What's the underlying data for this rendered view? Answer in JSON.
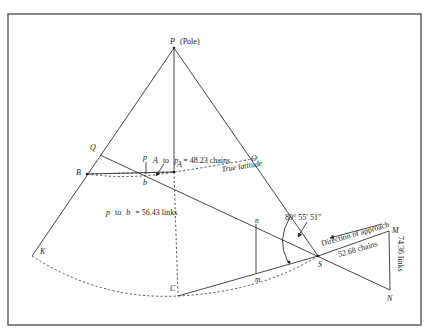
{
  "diagram": {
    "points": {
      "P": "P",
      "pole_note": "(Pole)",
      "Q": "Q",
      "B": "B",
      "A": "A",
      "O": "O",
      "K": "K",
      "C": "C",
      "S": "S",
      "M": "M",
      "N": "N",
      "p": "p",
      "b": "b",
      "n": "n",
      "m": "m"
    },
    "annotations": {
      "a_to_p_prefix": "A",
      "a_to_p_to": "to",
      "a_to_p_var": "p",
      "a_to_p_value": "= 48.23  chains",
      "p_to_b_var1": "p",
      "p_to_b_to": "to",
      "p_to_b_var2": "b",
      "p_to_b_value": "= 56.43  links",
      "true_latitude": "True latitude",
      "angle": "89°  55′  51″",
      "direction": "Direction  of  approach",
      "distance": "52.68  chains",
      "offset": "74.36  links"
    }
  }
}
